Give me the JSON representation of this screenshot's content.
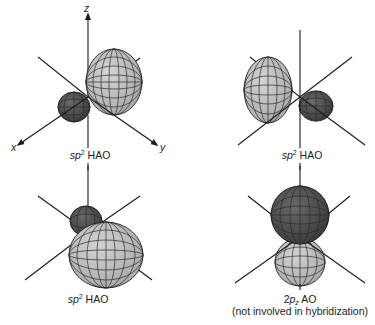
{
  "figure": {
    "colors": {
      "background": "#ffffff",
      "positive_lobe": "#bdbdbd",
      "negative_lobe": "#555555",
      "axis": "#1a1a1a"
    },
    "axis_labels": {
      "x": "x",
      "y": "y",
      "z": "z"
    },
    "panels": [
      {
        "id": "top-left",
        "orbital": "sp2",
        "caption_prefix": "sp",
        "caption_sup": "2",
        "caption_suffix": " HAO",
        "orientation": "large lobe toward +y (back-right), small dark lobe toward +x"
      },
      {
        "id": "top-right",
        "orbital": "sp2",
        "caption_prefix": "sp",
        "caption_sup": "2",
        "caption_suffix": " HAO",
        "orientation": "large lobe toward back-left, small dark lobe toward front-right"
      },
      {
        "id": "bottom-left",
        "orbital": "sp2",
        "caption_prefix": "sp",
        "caption_sup": "2",
        "caption_suffix": " HAO",
        "orientation": "large lobe toward front, small dark lobe toward back"
      },
      {
        "id": "bottom-right",
        "orbital": "2pz",
        "caption_prefix": "2p",
        "caption_sub": "z",
        "caption_suffix": " AO",
        "caption_note": "(not involved in hybridization)",
        "orientation": "dark lobe up (+z), light lobe down (-z)"
      }
    ]
  }
}
